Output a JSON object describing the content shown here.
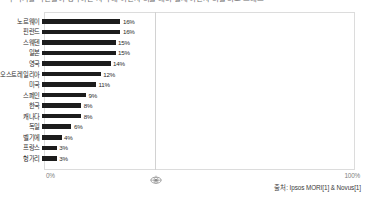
{
  "headline": "각 국가별 국민들이 생각하는 자국 내 이민자 비율 대비 실제 이민자 비율 비교 그래프",
  "chart_data": {
    "type": "bar",
    "orientation": "horizontal",
    "title": "",
    "xlabel": "",
    "ylabel": "",
    "xlim": [
      0,
      100
    ],
    "grid": false,
    "legend": null,
    "axis_ticks": [
      "0%",
      "100%"
    ],
    "categories": [
      "노르웨이",
      "핀란드",
      "스웨덴",
      "일본",
      "영국",
      "오스트레일리아",
      "미국",
      "스페인",
      "한국",
      "캐나다",
      "독일",
      "벨기에",
      "프랑스",
      "헝가리"
    ],
    "values": [
      16,
      16,
      15,
      15,
      14,
      12,
      11,
      9,
      8,
      8,
      6,
      4,
      3,
      3
    ],
    "value_labels": [
      "16%",
      "16%",
      "15%",
      "15%",
      "14%",
      "12%",
      "11%",
      "9%",
      "8%",
      "8%",
      "6%",
      "4%",
      "3%",
      "3%"
    ],
    "bar_color": "#1c1c1c"
  },
  "axis": {
    "left_tick": "0%",
    "right_tick": "100%"
  },
  "source": {
    "text": "출처: Ipsos MORI[1] & Novus[1]"
  },
  "icons": {
    "center_marker": "globe-marker-icon"
  }
}
